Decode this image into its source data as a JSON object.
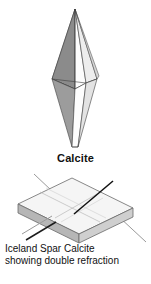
{
  "figure": {
    "background_color": "#ffffff",
    "width": 151,
    "height": 284
  },
  "crystal_top": {
    "name": "calcite-scalenohedron",
    "description": "elongated double-pyramid calcite crystal",
    "label": "Calcite",
    "facets": [
      {
        "id": "left-back",
        "shade": "#9a9a9a"
      },
      {
        "id": "left-front",
        "shade": "#8d8d8d"
      },
      {
        "id": "center-front",
        "shade": "#fbfbfb"
      },
      {
        "id": "right-front",
        "shade": "#ededed"
      },
      {
        "id": "right-back",
        "shade": "#d9d9d9"
      },
      {
        "id": "lower-left",
        "shade": "#9e9e9e"
      },
      {
        "id": "lower-center",
        "shade": "#fdfdfd"
      },
      {
        "id": "lower-right",
        "shade": "#e4e4e4"
      }
    ],
    "outline_color": "#3a3a3a"
  },
  "crystal_bottom": {
    "name": "iceland-spar-rhombohedron",
    "description": "flat rhombohedral cleavage block of Iceland spar showing double refraction",
    "faces": [
      {
        "id": "top-face",
        "shade": "#f4f4f4"
      },
      {
        "id": "front-face",
        "shade": "#dcdcdc"
      },
      {
        "id": "left-face",
        "shade": "#b4b4b4"
      },
      {
        "id": "right-face",
        "shade": "#c9c9c9"
      }
    ],
    "outline_color": "#5a5a5a",
    "incident_ray": {
      "id": "incident-ray",
      "color": "#111111",
      "label": "incident light ray"
    },
    "refracted_rays": [
      {
        "id": "ordinary-ray",
        "color": "#2a2a2a",
        "label": "ordinary ray"
      },
      {
        "id": "extraordinary-ray",
        "color": "#8d8d8d",
        "label": "extraordinary ray"
      }
    ]
  },
  "caption": {
    "line1": "Iceland Spar Calcite",
    "line2": "showing double refraction"
  }
}
